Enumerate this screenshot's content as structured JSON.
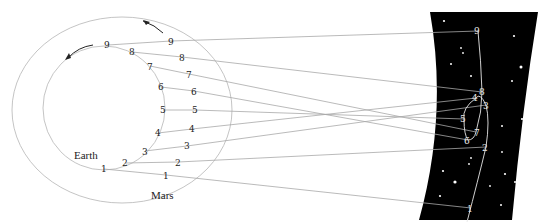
{
  "labels": {
    "earth": "Earth",
    "mars": "Mars"
  },
  "colors": {
    "background": "#ffffff",
    "sky": "#000000",
    "orbit": "#bdbdbd",
    "sightline": "#a8a8a8",
    "star": "#ffffff"
  },
  "earth_positions": [
    {
      "n": "1",
      "x": 104,
      "y": 169
    },
    {
      "n": "2",
      "x": 125,
      "y": 163
    },
    {
      "n": "3",
      "x": 145,
      "y": 151
    },
    {
      "n": "4",
      "x": 158,
      "y": 133
    },
    {
      "n": "5",
      "x": 163,
      "y": 110
    },
    {
      "n": "6",
      "x": 161,
      "y": 87
    },
    {
      "n": "7",
      "x": 150,
      "y": 66
    },
    {
      "n": "8",
      "x": 132,
      "y": 52
    },
    {
      "n": "9",
      "x": 108,
      "y": 45
    }
  ],
  "mars_positions": [
    {
      "n": "1",
      "x": 166,
      "y": 175
    },
    {
      "n": "2",
      "x": 178,
      "y": 162
    },
    {
      "n": "3",
      "x": 187,
      "y": 146
    },
    {
      "n": "4",
      "x": 192,
      "y": 129
    },
    {
      "n": "5",
      "x": 195,
      "y": 110
    },
    {
      "n": "6",
      "x": 194,
      "y": 91
    },
    {
      "n": "7",
      "x": 189,
      "y": 74
    },
    {
      "n": "8",
      "x": 182,
      "y": 57
    },
    {
      "n": "9",
      "x": 171,
      "y": 41
    }
  ],
  "sky_positions": [
    {
      "n": "1",
      "x": 471,
      "y": 208
    },
    {
      "n": "2",
      "x": 486,
      "y": 147
    },
    {
      "n": "3",
      "x": 486,
      "y": 105
    },
    {
      "n": "4",
      "x": 476,
      "y": 98
    },
    {
      "n": "5",
      "x": 464,
      "y": 119
    },
    {
      "n": "6",
      "x": 468,
      "y": 140
    },
    {
      "n": "7",
      "x": 476,
      "y": 132
    },
    {
      "n": "8",
      "x": 482,
      "y": 92
    },
    {
      "n": "9",
      "x": 478,
      "y": 31
    }
  ]
}
